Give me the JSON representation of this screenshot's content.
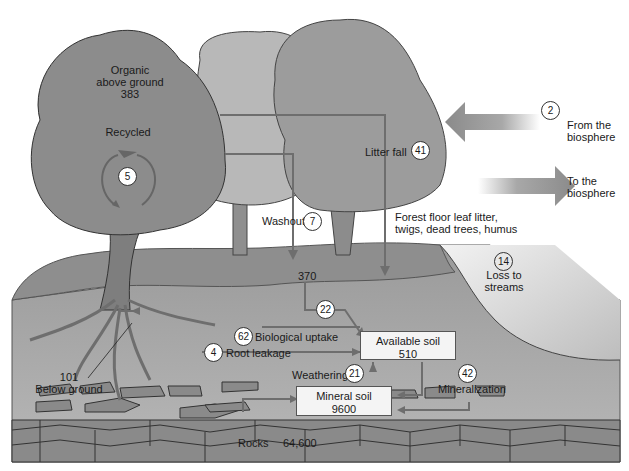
{
  "diagram": {
    "pools": {
      "organic_above_ground": {
        "label_1": "Organic",
        "label_2": "above ground",
        "value": "383"
      },
      "below_ground": {
        "value": "101",
        "label": "Below ground"
      },
      "forest_floor": {
        "label_1": "Forest floor leaf litter,",
        "label_2": "twigs, dead trees, humus",
        "value": "370"
      },
      "available_soil": {
        "label": "Available soil",
        "value": "510"
      },
      "mineral_soil": {
        "label": "Mineral soil",
        "value": "9600"
      },
      "rocks": {
        "label": "Rocks",
        "value": "64,600"
      }
    },
    "fluxes": {
      "recycled": {
        "label": "Recycled",
        "value": "5"
      },
      "washout": {
        "label": "Washout",
        "value": "7"
      },
      "litter_fall": {
        "label": "Litter fall",
        "value": "41"
      },
      "from_biosphere": {
        "label_1": "From the",
        "label_2": "biosphere",
        "value": "2"
      },
      "to_biosphere": {
        "label_1": "To the",
        "label_2": "biosphere"
      },
      "loss_to_streams": {
        "label_1": "Loss to",
        "label_2": "streams",
        "value": "14"
      },
      "forest_floor_to_soil": {
        "value": "22"
      },
      "biological_uptake": {
        "label": "Biological uptake",
        "value": "62"
      },
      "root_leakage": {
        "label": "Root leakage",
        "value": "4"
      },
      "weathering": {
        "label": "Weathering",
        "value": "21"
      },
      "mineralization": {
        "label": "Mineralization",
        "value": "42"
      }
    },
    "colors": {
      "tree_dark": "#8c8c8c",
      "tree_light": "#b0b0b0",
      "ground": "#8e8e8e",
      "soil": "#a2a2a2",
      "rock": "#8a8a8a",
      "arrow": "#777777",
      "box_fill": "#f4f4f4"
    }
  }
}
